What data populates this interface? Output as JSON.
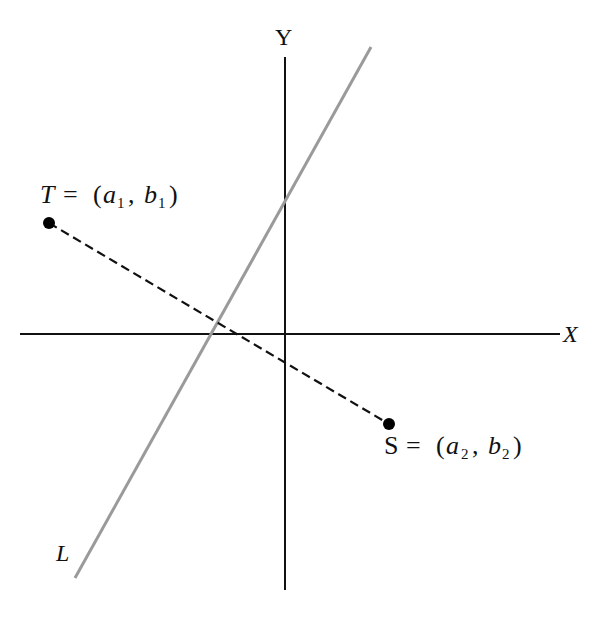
{
  "diagram": {
    "axes": {
      "x_label": "X",
      "y_label": "Y",
      "color": "#111111"
    },
    "line": {
      "label": "L",
      "color": "#999999"
    },
    "segment": {
      "style": "dashed",
      "color": "#111111"
    },
    "points": [
      {
        "name": "T",
        "eq": "=",
        "open": "(",
        "a": "a",
        "a_sub": "1",
        "comma": ",",
        "b": "b",
        "b_sub": "1",
        "close": ")"
      },
      {
        "name": "S",
        "eq": "=",
        "open": "(",
        "a": "a",
        "a_sub": "2",
        "comma": ",",
        "b": "b",
        "b_sub": "2",
        "close": ")"
      }
    ]
  }
}
